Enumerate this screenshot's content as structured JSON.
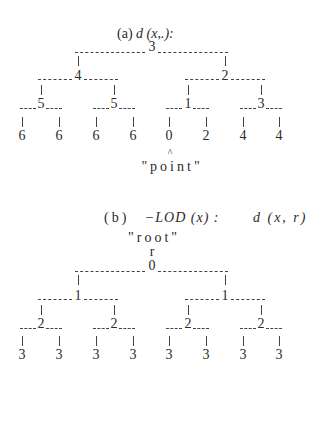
{
  "figure_a": {
    "caption_prefix": "(a)",
    "caption_math": "d (x,.):",
    "tree": {
      "root": "3",
      "level1": [
        "4",
        "2"
      ],
      "level2": [
        "5",
        "5",
        "1",
        "3"
      ],
      "leaves": [
        "6",
        "6",
        "6",
        "6",
        "0",
        "2",
        "4",
        "4"
      ]
    },
    "pointer": "^",
    "pointer_label": "\"point\""
  },
  "figure_b": {
    "caption_prefix": "(b)",
    "caption_math": "−LOD (x) :",
    "caption_rhs": "d (x, r)",
    "root_label": "\"root\"",
    "root_symbol": "r",
    "tree": {
      "root": "0",
      "level1": [
        "1",
        "1"
      ],
      "level2": [
        "2",
        "2",
        "2",
        "2"
      ],
      "leaves": [
        "3",
        "3",
        "3",
        "3",
        "3",
        "3",
        "3",
        "3"
      ]
    }
  }
}
